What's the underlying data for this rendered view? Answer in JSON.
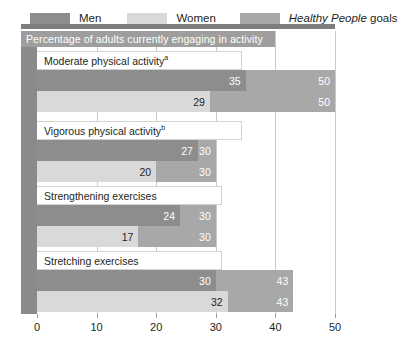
{
  "legend": {
    "items": [
      {
        "label": "Men",
        "color": "#8d8d8d",
        "icon": "legend-swatch-men"
      },
      {
        "label": "Women",
        "color": "#d9d9d9",
        "icon": "legend-swatch-women"
      },
      {
        "label_italic": "Healthy People",
        "label_rest": " goals",
        "color": "#a8a8a8",
        "icon": "legend-swatch-goals"
      }
    ]
  },
  "chart_data": {
    "type": "bar",
    "orientation": "horizontal",
    "title": "Percentage of adults currently engaging in activity",
    "xlabel": "",
    "ylabel": "",
    "xlim": [
      0,
      50
    ],
    "xticks": [
      0,
      10,
      20,
      30,
      40,
      50
    ],
    "xticklabels": [
      "0",
      "10",
      "20",
      "30",
      "40",
      "50"
    ],
    "grid": true,
    "legend_position": "top",
    "categories": [
      "Moderate physical activity",
      "Vigorous physical activity",
      "Strengthening exercises",
      "Stretching exercises"
    ],
    "category_footnotes": [
      "a",
      "b",
      "",
      ""
    ],
    "series": [
      {
        "name": "Men",
        "values": [
          35,
          27,
          24,
          30
        ]
      },
      {
        "name": "Women",
        "values": [
          29,
          20,
          17,
          32
        ]
      },
      {
        "name": "Healthy People goals",
        "values": [
          50,
          30,
          30,
          43
        ]
      }
    ],
    "groups": [
      {
        "label": "Moderate physical activity",
        "footnote": "a",
        "bars": [
          {
            "series": "Men",
            "value": 35,
            "goal": 50
          },
          {
            "series": "Women",
            "value": 29,
            "goal": 50
          }
        ]
      },
      {
        "label": "Vigorous physical activity",
        "footnote": "b",
        "bars": [
          {
            "series": "Men",
            "value": 27,
            "goal": 30
          },
          {
            "series": "Women",
            "value": 20,
            "goal": 30
          }
        ]
      },
      {
        "label": "Strengthening exercises",
        "footnote": "",
        "bars": [
          {
            "series": "Men",
            "value": 24,
            "goal": 30
          },
          {
            "series": "Women",
            "value": 17,
            "goal": 30
          }
        ]
      },
      {
        "label": "Stretching exercises",
        "footnote": "",
        "bars": [
          {
            "series": "Men",
            "value": 30,
            "goal": 43
          },
          {
            "series": "Women",
            "value": 32,
            "goal": 43
          }
        ]
      }
    ]
  },
  "colors": {
    "men": "#8d8d8d",
    "women": "#d9d9d9",
    "goal": "#a8a8a8",
    "title_bar": "#9e9e9e",
    "left_band": "#8a8a8a",
    "grid": "#c9c9c9",
    "text": "#231f20"
  }
}
